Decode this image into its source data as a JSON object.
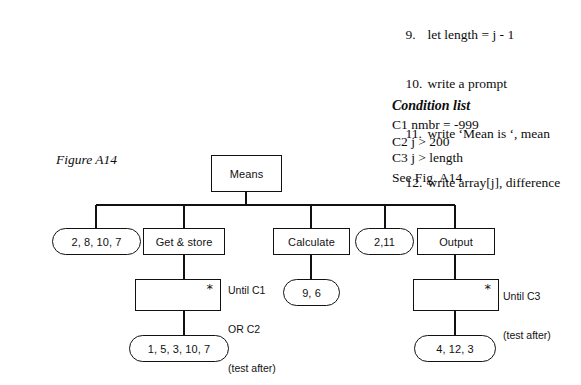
{
  "figure": {
    "label": "Figure A14"
  },
  "pseudocode": {
    "lines": [
      {
        "num": "9.",
        "text": "let length = j - 1"
      },
      {
        "num": "10.",
        "text": "write a prompt"
      },
      {
        "num": "11.",
        "text": "write ‘Mean is ‘, mean"
      },
      {
        "num": "12.",
        "text": "write array[j], difference"
      }
    ]
  },
  "condition_list": {
    "heading": "Condition list",
    "conditions": [
      "C1 nmbr = -999",
      "C2 j > 200",
      "C3 j > length"
    ]
  },
  "see_figure": "See Fig. A14",
  "diagram": {
    "root": {
      "label": "Means"
    },
    "level2": [
      {
        "label": "2, 8, 10, 7",
        "shape": "rounded"
      },
      {
        "label": "Get & store",
        "shape": "rect"
      },
      {
        "label": "Calculate",
        "shape": "rect"
      },
      {
        "label": "2,11",
        "shape": "rounded"
      },
      {
        "label": "Output",
        "shape": "rect"
      }
    ],
    "loops": [
      {
        "label": "",
        "marker": "*",
        "shape": "rect"
      },
      {
        "label": "",
        "marker": "*",
        "shape": "rect"
      }
    ],
    "level3": [
      {
        "label": "9, 6",
        "shape": "rounded"
      }
    ],
    "level4": [
      {
        "label": "1, 5, 3, 10, 7",
        "shape": "rounded"
      },
      {
        "label": "4, 12, 3",
        "shape": "rounded"
      }
    ],
    "annotations": [
      {
        "lines": [
          "Until C1",
          "OR C2",
          "(test after)"
        ]
      },
      {
        "lines": [
          "Until C3",
          "(test after)"
        ]
      }
    ]
  },
  "colors": {
    "ink": "#111111",
    "background": "#ffffff"
  }
}
